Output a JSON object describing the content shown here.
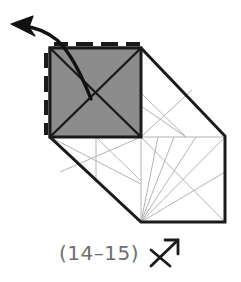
{
  "figure": {
    "caption": "(14–15)",
    "symbol_name": "cross-with-up-right-arrow",
    "colors": {
      "outline": "#1a1a1a",
      "shaded_face": "#8c8c8c",
      "construction_line": "#b4b4b4",
      "caption_text": "#6e6e6e",
      "background": "#ffffff",
      "arrow": "#111111"
    },
    "shaded_face": {
      "name": "shaded-square-face",
      "fill": "#8c8c8c",
      "x": 50,
      "y": 48,
      "width": 91,
      "height": 89,
      "diagonals": true,
      "tick_marks_top": 4,
      "tick_marks_left": 4
    },
    "body_outline": {
      "name": "box-outline",
      "points": "50,48 141,48 225,136 225,222 141,222 50,137"
    },
    "fold_arrow": {
      "name": "curved-fold-arrow",
      "direction": "up-left",
      "start": [
        91,
        99
      ],
      "end": [
        16,
        28
      ]
    },
    "construction_lines": [
      {
        "name": "top-face-diagonal-a",
        "x1": 50,
        "y1": 48,
        "x2": 141,
        "y2": 137
      },
      {
        "name": "top-face-diagonal-b",
        "x1": 141,
        "y1": 48,
        "x2": 50,
        "y2": 137
      },
      {
        "name": "front-face-diagonal-a",
        "x1": 141,
        "y1": 137,
        "x2": 225,
        "y2": 222
      },
      {
        "name": "front-face-diagonal-b",
        "x1": 225,
        "y1": 137,
        "x2": 141,
        "y2": 222
      },
      {
        "name": "front-face-top-edge",
        "x1": 141,
        "y1": 137,
        "x2": 225,
        "y2": 137
      },
      {
        "name": "front-face-left-edge",
        "x1": 141,
        "y1": 137,
        "x2": 141,
        "y2": 222
      },
      {
        "name": "side-crease-vertical",
        "x1": 96,
        "y1": 137,
        "x2": 96,
        "y2": 182
      },
      {
        "name": "side-crease-diagonal-a",
        "x1": 50,
        "y1": 137,
        "x2": 141,
        "y2": 184
      },
      {
        "name": "side-crease-diagonal-b",
        "x1": 96,
        "y1": 137,
        "x2": 141,
        "y2": 180
      },
      {
        "name": "side-crease-diagonal-c",
        "x1": 141,
        "y1": 137,
        "x2": 60,
        "y2": 172
      },
      {
        "name": "upper-crease-a",
        "x1": 141,
        "y1": 93,
        "x2": 185,
        "y2": 137
      },
      {
        "name": "upper-crease-b",
        "x1": 141,
        "y1": 108,
        "x2": 185,
        "y2": 137
      },
      {
        "name": "upper-crease-c",
        "x1": 141,
        "y1": 137,
        "x2": 190,
        "y2": 92
      },
      {
        "name": "lower-fan-a",
        "x1": 141,
        "y1": 222,
        "x2": 160,
        "y2": 137
      },
      {
        "name": "lower-fan-b",
        "x1": 141,
        "y1": 222,
        "x2": 176,
        "y2": 137
      },
      {
        "name": "lower-fan-c",
        "x1": 141,
        "y1": 222,
        "x2": 196,
        "y2": 137
      },
      {
        "name": "lower-fan-d",
        "x1": 141,
        "y1": 222,
        "x2": 225,
        "y2": 173
      }
    ]
  }
}
